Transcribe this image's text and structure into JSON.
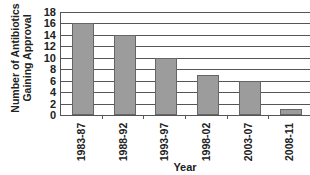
{
  "chart_data": {
    "type": "bar",
    "title": "",
    "xlabel": "Year",
    "ylabel": "Number of Antibiotics Gaining Approval",
    "ylabel_lines": [
      "Number of Antibiotics",
      "Gaining Approval"
    ],
    "categories": [
      "1983-87",
      "1988-92",
      "1993-97",
      "1998-02",
      "2003-07",
      "2008-11"
    ],
    "values": [
      16,
      14,
      10,
      7,
      6,
      1
    ],
    "ylim": [
      0,
      18
    ],
    "yticks": [
      0,
      2,
      4,
      6,
      8,
      10,
      12,
      14,
      16,
      18
    ],
    "grid": true,
    "legend": null,
    "bar_color": "#9c9c9c"
  }
}
